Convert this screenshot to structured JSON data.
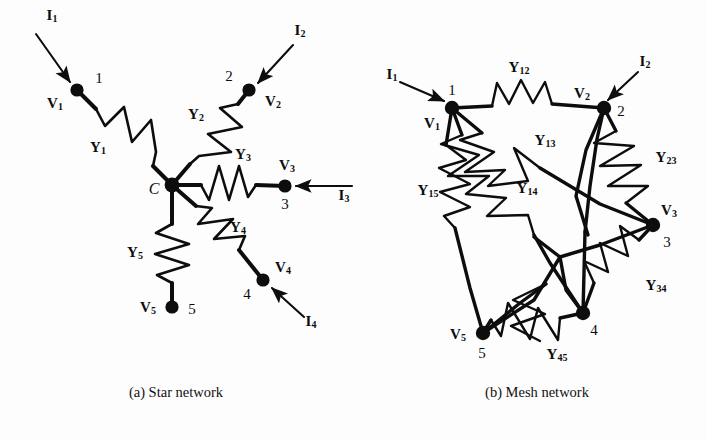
{
  "figure": {
    "background": "#fdfdfd",
    "ink": "#0d0d0d",
    "width": 706,
    "height": 439
  },
  "captions": {
    "left": "(a) Star network",
    "right": "(b) Mesh network"
  },
  "star_network": {
    "center_label": "C",
    "nodes": [
      {
        "id": "1",
        "number": "1",
        "voltage": "V",
        "voltage_sub": "1",
        "x": 77,
        "y": 90,
        "num_dx": 22,
        "num_dy": -12,
        "volt_dx": -22,
        "volt_dy": 14
      },
      {
        "id": "2",
        "number": "2",
        "voltage": "V",
        "voltage_sub": "2",
        "x": 249,
        "y": 90,
        "num_dx": -20,
        "num_dy": -14,
        "volt_dx": 24,
        "volt_dy": 12
      },
      {
        "id": "3",
        "number": "3",
        "voltage": "V",
        "voltage_sub": "3",
        "x": 285,
        "y": 186,
        "num_dx": 0,
        "num_dy": 18,
        "volt_dx": 2,
        "volt_dy": -20
      },
      {
        "id": "4",
        "number": "4",
        "voltage": "V",
        "voltage_sub": "4",
        "x": 263,
        "y": 280,
        "num_dx": -16,
        "num_dy": 14,
        "volt_dx": 20,
        "volt_dy": -12
      },
      {
        "id": "5",
        "number": "5",
        "voltage": "V",
        "voltage_sub": "5",
        "x": 172,
        "y": 307,
        "num_dx": 20,
        "num_dy": 2,
        "volt_dx": -24,
        "volt_dy": 1
      }
    ],
    "center": {
      "x": 172,
      "y": 185,
      "label_dx": -18,
      "label_dy": 4
    },
    "admittances": [
      {
        "name": "Y",
        "sub": "1",
        "x": 98,
        "y": 148
      },
      {
        "name": "Y",
        "sub": "2",
        "x": 196,
        "y": 115
      },
      {
        "name": "Y",
        "sub": "3",
        "x": 243,
        "y": 155
      },
      {
        "name": "Y",
        "sub": "4",
        "x": 238,
        "y": 228
      },
      {
        "name": "Y",
        "sub": "5",
        "x": 135,
        "y": 253
      }
    ],
    "currents": [
      {
        "name": "I",
        "sub": "1",
        "x": 52,
        "y": 16
      },
      {
        "name": "I",
        "sub": "2",
        "x": 300,
        "y": 31
      },
      {
        "name": "I",
        "sub": "3",
        "x": 344,
        "y": 196
      },
      {
        "name": "I",
        "sub": "4",
        "x": 311,
        "y": 322
      }
    ]
  },
  "mesh_network": {
    "nodes": [
      {
        "id": "1",
        "number": "1",
        "voltage": "V",
        "voltage_sub": "1",
        "x": 452,
        "y": 108,
        "num_dx": 0,
        "num_dy": -18,
        "volt_dx": -20,
        "volt_dy": 16
      },
      {
        "id": "2",
        "number": "2",
        "voltage": "V",
        "voltage_sub": "2",
        "x": 604,
        "y": 108,
        "num_dx": 17,
        "num_dy": 3,
        "volt_dx": -22,
        "volt_dy": -14
      },
      {
        "id": "3",
        "number": "3",
        "voltage": "V",
        "voltage_sub": "3",
        "x": 653,
        "y": 225,
        "num_dx": 14,
        "num_dy": 17,
        "volt_dx": 16,
        "volt_dy": -14
      },
      {
        "id": "4",
        "number": "4",
        "voltage": "V",
        "voltage_sub": "4",
        "x": 583,
        "y": 313,
        "num_dx": 11,
        "num_dy": 17,
        "volt_dx": 999,
        "volt_dy": 999
      },
      {
        "id": "5",
        "number": "5",
        "voltage": "V",
        "voltage_sub": "5",
        "x": 483,
        "y": 333,
        "num_dx": -1,
        "num_dy": 20,
        "volt_dx": -25,
        "volt_dy": 2
      }
    ],
    "admittances": [
      {
        "name": "Y",
        "sub": "12",
        "x": 519,
        "y": 68
      },
      {
        "name": "Y",
        "sub": "13",
        "x": 545,
        "y": 141
      },
      {
        "name": "Y",
        "sub": "14",
        "x": 527,
        "y": 189
      },
      {
        "name": "Y",
        "sub": "15",
        "x": 428,
        "y": 191
      },
      {
        "name": "Y",
        "sub": "23",
        "x": 666,
        "y": 158
      },
      {
        "name": "Y",
        "sub": "34",
        "x": 656,
        "y": 286
      },
      {
        "name": "Y",
        "sub": "45",
        "x": 557,
        "y": 355
      }
    ],
    "currents": [
      {
        "name": "I",
        "sub": "1",
        "x": 392,
        "y": 75
      },
      {
        "name": "I",
        "sub": "2",
        "x": 645,
        "y": 62
      }
    ]
  }
}
